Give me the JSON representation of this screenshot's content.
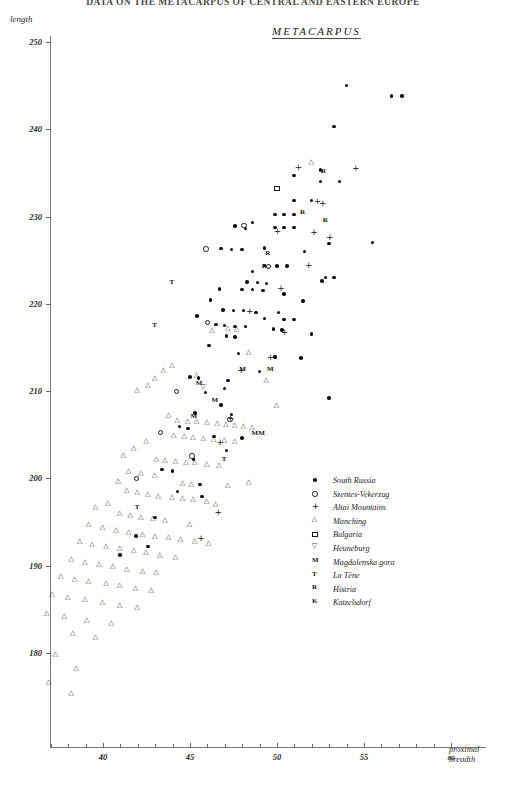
{
  "header": {
    "running_title": "DATA ON THE METACARPUS OF CENTRAL AND EASTERN EUROPE"
  },
  "plot": {
    "title": "METACARPUS",
    "y_axis_label": "length",
    "x_axis_label_line1": "proximal",
    "x_axis_label_line2": "breadth",
    "y_ticks": [
      180,
      190,
      200,
      210,
      220,
      230,
      240,
      250
    ],
    "x_ticks": [
      40,
      45,
      50,
      55,
      60
    ],
    "x_minor_step": 1,
    "accent_color": "#0d0d0d"
  },
  "legend": {
    "items": [
      {
        "marker": "filled-dot",
        "glyph": "",
        "label": "South Russia"
      },
      {
        "marker": "open-circle",
        "glyph": "",
        "label": "Szentes-Vekerzug"
      },
      {
        "marker": "plus",
        "glyph": "",
        "label": "Altai Mountains"
      },
      {
        "marker": "open-triangle",
        "glyph": "",
        "label": "Manching"
      },
      {
        "marker": "open-square",
        "glyph": "",
        "label": "Bulgaria"
      },
      {
        "marker": "down-triangle",
        "glyph": "",
        "label": "Heuneburg"
      },
      {
        "marker": "letter",
        "glyph": "M",
        "label": "Magdalenska gora"
      },
      {
        "marker": "letter",
        "glyph": "T",
        "label": "La Tène"
      },
      {
        "marker": "letter",
        "glyph": "R",
        "label": "Histria"
      },
      {
        "marker": "letter",
        "glyph": "K",
        "label": "Katzelsdorf"
      }
    ]
  },
  "chart_data": {
    "type": "scatter",
    "title": "METACARPUS",
    "xlabel": "proximal breadth",
    "ylabel": "length",
    "xlim": [
      36.2,
      61.0
    ],
    "ylim": [
      173.0,
      251.5
    ],
    "grid": false,
    "legend_position": "center-right",
    "series": [
      {
        "name": "South Russia",
        "marker": "filled-dot",
        "points": [
          [
            54.0,
            245.0
          ],
          [
            56.6,
            243.8
          ],
          [
            57.2,
            243.8
          ],
          [
            53.3,
            240.3
          ],
          [
            52.5,
            235.3
          ],
          [
            52.5,
            234.0
          ],
          [
            51.0,
            231.8
          ],
          [
            52.0,
            231.8
          ],
          [
            49.9,
            230.2
          ],
          [
            50.4,
            230.2
          ],
          [
            51.0,
            230.2
          ],
          [
            48.6,
            229.3
          ],
          [
            49.9,
            228.7
          ],
          [
            50.4,
            228.7
          ],
          [
            51.0,
            228.7
          ],
          [
            55.5,
            227.0
          ],
          [
            48.2,
            228.6
          ],
          [
            47.6,
            228.9
          ],
          [
            49.3,
            226.4
          ],
          [
            46.8,
            226.3
          ],
          [
            47.4,
            226.2
          ],
          [
            48.0,
            226.2
          ],
          [
            51.6,
            226.0
          ],
          [
            49.3,
            224.4
          ],
          [
            50.0,
            224.3
          ],
          [
            50.6,
            224.3
          ],
          [
            48.6,
            223.7
          ],
          [
            52.8,
            223.0
          ],
          [
            53.3,
            223.0
          ],
          [
            48.3,
            222.5
          ],
          [
            48.9,
            222.4
          ],
          [
            49.4,
            222.3
          ],
          [
            46.7,
            221.7
          ],
          [
            48.0,
            221.6
          ],
          [
            48.6,
            221.6
          ],
          [
            49.2,
            221.5
          ],
          [
            50.4,
            221.1
          ],
          [
            46.9,
            219.3
          ],
          [
            47.5,
            219.2
          ],
          [
            48.1,
            219.2
          ],
          [
            48.8,
            219.0
          ],
          [
            50.1,
            219.0
          ],
          [
            49.3,
            218.3
          ],
          [
            50.4,
            218.2
          ],
          [
            51.0,
            218.2
          ],
          [
            46.5,
            217.6
          ],
          [
            47.0,
            217.5
          ],
          [
            47.6,
            217.4
          ],
          [
            48.2,
            217.4
          ],
          [
            49.8,
            217.1
          ],
          [
            50.3,
            217.0
          ],
          [
            47.1,
            216.3
          ],
          [
            47.6,
            216.2
          ],
          [
            46.1,
            215.2
          ],
          [
            47.8,
            214.3
          ],
          [
            49.9,
            213.9
          ],
          [
            51.4,
            213.8
          ],
          [
            45.0,
            211.6
          ],
          [
            45.5,
            211.5
          ],
          [
            47.2,
            211.2
          ],
          [
            47.0,
            210.3
          ],
          [
            45.9,
            209.8
          ],
          [
            53.0,
            209.2
          ],
          [
            46.8,
            208.4
          ],
          [
            45.3,
            207.5
          ],
          [
            47.4,
            207.3
          ],
          [
            44.4,
            205.9
          ],
          [
            44.9,
            205.7
          ],
          [
            46.4,
            204.8
          ],
          [
            48.0,
            204.6
          ],
          [
            47.1,
            203.2
          ],
          [
            45.2,
            202.2
          ],
          [
            43.4,
            201.0
          ],
          [
            44.0,
            200.8
          ],
          [
            45.6,
            199.3
          ],
          [
            44.3,
            198.5
          ],
          [
            45.7,
            197.9
          ],
          [
            43.0,
            195.5
          ],
          [
            41.9,
            193.4
          ],
          [
            42.6,
            192.2
          ],
          [
            41.0,
            191.2
          ],
          [
            45.4,
            218.6
          ],
          [
            46.2,
            220.4
          ],
          [
            49.0,
            212.2
          ],
          [
            51.5,
            220.3
          ],
          [
            52.0,
            216.5
          ],
          [
            52.6,
            222.6
          ],
          [
            53.0,
            226.9
          ],
          [
            51.0,
            234.7
          ],
          [
            53.6,
            234.0
          ]
        ]
      },
      {
        "name": "Szentes-Vekerzug",
        "marker": "open-circle",
        "points": [
          [
            45.9,
            226.3
          ],
          [
            48.1,
            229.0
          ],
          [
            49.5,
            224.3
          ],
          [
            46.0,
            217.9
          ],
          [
            44.2,
            210.0
          ],
          [
            43.3,
            205.3
          ],
          [
            45.1,
            202.6
          ],
          [
            47.3,
            206.8
          ],
          [
            41.9,
            200.0
          ]
        ]
      },
      {
        "name": "Altai Mountains",
        "marker": "plus",
        "points": [
          [
            51.2,
            235.5
          ],
          [
            52.3,
            231.6
          ],
          [
            54.5,
            235.4
          ],
          [
            53.0,
            227.5
          ],
          [
            51.8,
            224.3
          ],
          [
            50.2,
            221.6
          ],
          [
            48.4,
            219.0
          ],
          [
            50.4,
            216.6
          ],
          [
            49.6,
            213.7
          ],
          [
            47.9,
            212.2
          ],
          [
            47.3,
            206.8
          ],
          [
            46.7,
            204.0
          ],
          [
            52.6,
            231.4
          ],
          [
            50.0,
            228.2
          ],
          [
            52.1,
            228.0
          ],
          [
            45.6,
            193.0
          ],
          [
            46.6,
            196.0
          ]
        ]
      },
      {
        "name": "Manching",
        "marker": "open-triangle",
        "points": [
          [
            52.0,
            236.0
          ],
          [
            46.3,
            216.8
          ],
          [
            47.2,
            217.0
          ],
          [
            47.7,
            216.9
          ],
          [
            45.4,
            211.6
          ],
          [
            44.0,
            212.8
          ],
          [
            43.5,
            212.2
          ],
          [
            43.0,
            211.3
          ],
          [
            42.6,
            210.5
          ],
          [
            42.0,
            209.9
          ],
          [
            43.8,
            207.0
          ],
          [
            44.3,
            206.5
          ],
          [
            44.9,
            206.4
          ],
          [
            45.4,
            206.3
          ],
          [
            46.0,
            206.2
          ],
          [
            46.6,
            206.1
          ],
          [
            47.1,
            206.0
          ],
          [
            47.6,
            205.9
          ],
          [
            48.1,
            205.8
          ],
          [
            48.6,
            205.6
          ],
          [
            44.1,
            204.7
          ],
          [
            44.7,
            204.6
          ],
          [
            45.2,
            204.5
          ],
          [
            45.8,
            204.4
          ],
          [
            46.4,
            204.3
          ],
          [
            47.0,
            204.2
          ],
          [
            47.6,
            204.1
          ],
          [
            42.5,
            204.0
          ],
          [
            41.8,
            203.2
          ],
          [
            41.2,
            202.4
          ],
          [
            43.1,
            202.0
          ],
          [
            43.6,
            201.9
          ],
          [
            44.2,
            201.8
          ],
          [
            44.8,
            201.7
          ],
          [
            45.3,
            201.6
          ],
          [
            46.0,
            201.4
          ],
          [
            46.7,
            201.3
          ],
          [
            41.5,
            200.6
          ],
          [
            42.2,
            200.4
          ],
          [
            43.0,
            200.2
          ],
          [
            44.6,
            199.2
          ],
          [
            45.1,
            199.1
          ],
          [
            47.2,
            199.0
          ],
          [
            48.4,
            199.4
          ],
          [
            40.9,
            199.5
          ],
          [
            41.4,
            198.4
          ],
          [
            42.0,
            198.2
          ],
          [
            42.6,
            198.0
          ],
          [
            43.2,
            197.8
          ],
          [
            44.0,
            197.6
          ],
          [
            44.6,
            197.5
          ],
          [
            45.2,
            197.4
          ],
          [
            46.0,
            197.2
          ],
          [
            40.3,
            197.0
          ],
          [
            39.6,
            196.5
          ],
          [
            41.0,
            195.8
          ],
          [
            41.6,
            195.6
          ],
          [
            42.2,
            195.4
          ],
          [
            42.9,
            195.2
          ],
          [
            43.6,
            195.0
          ],
          [
            39.2,
            194.5
          ],
          [
            40.0,
            194.2
          ],
          [
            40.8,
            193.8
          ],
          [
            41.5,
            193.6
          ],
          [
            42.3,
            193.4
          ],
          [
            43.0,
            193.2
          ],
          [
            43.8,
            193.0
          ],
          [
            44.5,
            192.8
          ],
          [
            45.3,
            192.6
          ],
          [
            46.1,
            192.4
          ],
          [
            38.7,
            192.6
          ],
          [
            39.4,
            192.3
          ],
          [
            40.2,
            192.0
          ],
          [
            41.0,
            191.8
          ],
          [
            41.8,
            191.6
          ],
          [
            42.5,
            191.3
          ],
          [
            43.3,
            191.0
          ],
          [
            44.2,
            190.8
          ],
          [
            38.2,
            190.5
          ],
          [
            39.0,
            190.2
          ],
          [
            39.8,
            190.0
          ],
          [
            40.6,
            189.7
          ],
          [
            41.4,
            189.4
          ],
          [
            42.3,
            189.2
          ],
          [
            43.1,
            189.0
          ],
          [
            37.6,
            188.6
          ],
          [
            38.4,
            188.3
          ],
          [
            39.2,
            188.0
          ],
          [
            40.2,
            187.8
          ],
          [
            41.0,
            187.5
          ],
          [
            41.9,
            187.2
          ],
          [
            42.8,
            187.0
          ],
          [
            37.1,
            186.5
          ],
          [
            38.0,
            186.2
          ],
          [
            39.0,
            185.9
          ],
          [
            40.0,
            185.6
          ],
          [
            41.0,
            185.3
          ],
          [
            42.0,
            185.0
          ],
          [
            36.8,
            184.4
          ],
          [
            37.8,
            184.0
          ],
          [
            39.1,
            183.6
          ],
          [
            40.5,
            183.2
          ],
          [
            38.3,
            182.0
          ],
          [
            39.6,
            181.6
          ],
          [
            37.3,
            179.6
          ],
          [
            38.5,
            178.0
          ],
          [
            36.9,
            176.4
          ],
          [
            38.2,
            175.2
          ],
          [
            48.4,
            214.3
          ],
          [
            49.4,
            211.0
          ],
          [
            50.0,
            208.2
          ],
          [
            46.5,
            196.8
          ],
          [
            45.0,
            194.5
          ]
        ]
      },
      {
        "name": "Bulgaria",
        "marker": "open-square",
        "points": [
          [
            50.0,
            233.2
          ]
        ]
      },
      {
        "name": "Heuneburg",
        "marker": "down-triangle",
        "points": [
          [
            45.8,
            210.2
          ]
        ]
      },
      {
        "name": "Magdalenska gora",
        "marker": "letter",
        "glyph": "M",
        "points": [
          [
            45.5,
            210.7
          ],
          [
            48.0,
            212.4
          ],
          [
            49.6,
            212.4
          ],
          [
            45.2,
            207.0
          ],
          [
            46.4,
            208.8
          ],
          [
            48.7,
            205.0
          ],
          [
            49.1,
            205.0
          ]
        ]
      },
      {
        "name": "La Tène",
        "marker": "letter",
        "glyph": "T",
        "points": [
          [
            44.0,
            222.3
          ],
          [
            43.0,
            217.4
          ],
          [
            42.0,
            196.6
          ],
          [
            47.0,
            202.0
          ]
        ]
      },
      {
        "name": "Histria",
        "marker": "letter",
        "glyph": "R",
        "points": [
          [
            52.7,
            235.0
          ],
          [
            51.5,
            230.3
          ],
          [
            52.8,
            229.4
          ],
          [
            49.5,
            225.6
          ],
          [
            49.3,
            224.2
          ]
        ]
      },
      {
        "name": "Katzelsdorf",
        "marker": "letter",
        "glyph": "K",
        "points": []
      }
    ]
  }
}
